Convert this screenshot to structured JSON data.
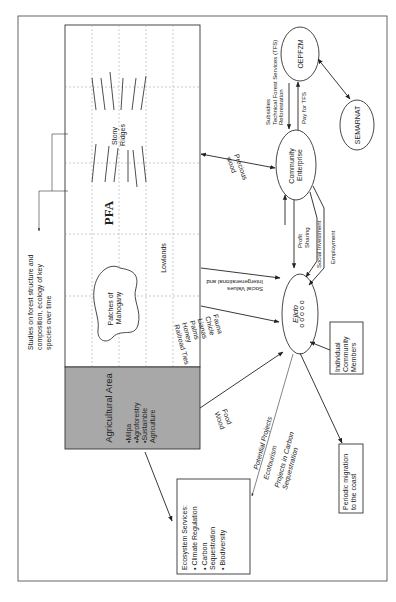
{
  "diagram": {
    "orientation": "rotated 90 degrees counterclockwise",
    "forest_area": {
      "label": "PFA",
      "stony_ridges": [
        "Stony",
        "Ridges"
      ],
      "lowlands": "Lowlands",
      "mahogany": [
        "Patches of",
        "Mahogany"
      ]
    },
    "agricultural_area": {
      "title": "Agricultural Area",
      "items": [
        "•Milpa",
        "•Agroforestry",
        "•Sustainble",
        " Agriculture"
      ],
      "fill_color": "#a8a8a8"
    },
    "studies_note": [
      "Studies on forest structure and",
      "composition, ecology of key",
      "species over time"
    ],
    "nodes": {
      "oepfzm": "OEPFZM",
      "semarnat": "SEMARNAT",
      "community_enterprise": [
        "Community",
        "Enterprise"
      ],
      "ejido": "Ejido",
      "ejido_circles": "o o o o o",
      "individual_members": [
        "Individual",
        "Community",
        "Members"
      ],
      "periodic_migration": [
        "Periodic migration",
        "to the coast"
      ],
      "ecosystem_services": {
        "title": "Ecosystem Services:",
        "items": [
          "•  Climate Regulation",
          "•  Carbon",
          "    Sequestration",
          "•  Biodiversity"
        ]
      }
    },
    "edge_labels": {
      "subsidies": [
        "Subsidies",
        "Technical Forest Services (TFS)",
        "Reforestation"
      ],
      "pay_for_tfs": "Pay for TFS",
      "precious_wood": [
        "Precious",
        "wood"
      ],
      "profit_sharing": [
        "Profit",
        "Sharing"
      ],
      "social_investment": "Social Investment",
      "employment": "Employment",
      "intergenerational": [
        "Intergenerational and",
        "Social Values"
      ],
      "forest_products": [
        "Fauna",
        "Chicle",
        "Lianas",
        "Palms",
        "Honey",
        "Railroad Ties"
      ],
      "food_wood": [
        "Food",
        "Wood"
      ],
      "potential_projects": [
        "Potential Projects",
        "Ecotourism",
        "Projects in Carbon",
        "Sequestration"
      ]
    }
  }
}
